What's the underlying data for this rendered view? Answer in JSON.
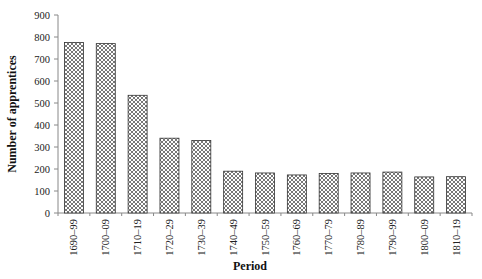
{
  "chart_data": {
    "type": "bar",
    "title": "",
    "xlabel": "Period",
    "ylabel": "Number of apprentices",
    "ylim": [
      0,
      900
    ],
    "yticks": [
      0,
      100,
      200,
      300,
      400,
      500,
      600,
      700,
      800,
      900
    ],
    "grid": false,
    "legend": null,
    "bar_fill": "crosshatch",
    "categories": [
      "1690–99",
      "1700–09",
      "1710–19",
      "1720–29",
      "1730–39",
      "1740–49",
      "1750–59",
      "1760–69",
      "1770–79",
      "1780–89",
      "1790–99",
      "1800–09",
      "1810–19"
    ],
    "values": [
      775,
      770,
      535,
      340,
      330,
      190,
      182,
      173,
      180,
      182,
      186,
      164,
      165
    ]
  },
  "colors": {
    "bar_stroke": "#333333",
    "hatch": "#555555",
    "axis": "#888888",
    "background": "#ffffff"
  }
}
